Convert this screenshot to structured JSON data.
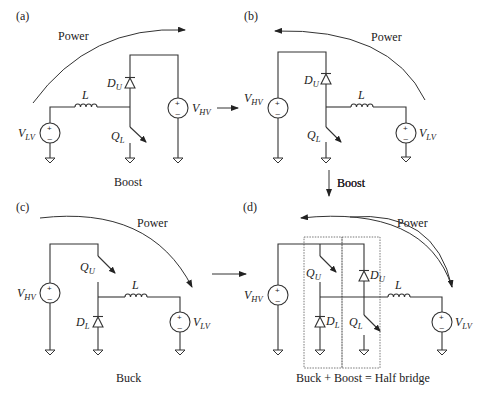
{
  "figure": {
    "panels": [
      {
        "id": "a",
        "tag": "(a)",
        "caption": "Boost",
        "power_label": "Power",
        "power_direction": "left-to-right",
        "components": {
          "source_low": {
            "name": "V",
            "sub": "LV"
          },
          "source_high": {
            "name": "V",
            "sub": "HV"
          },
          "inductor": {
            "name": "L"
          },
          "diode": {
            "name": "D",
            "sub": "U"
          },
          "switch": {
            "name": "Q",
            "sub": "L"
          }
        }
      },
      {
        "id": "b",
        "tag": "(b)",
        "caption": "Boost",
        "power_label": "Power",
        "power_direction": "right-to-left",
        "components": {
          "source_high": {
            "name": "V",
            "sub": "HV"
          },
          "source_low": {
            "name": "V",
            "sub": "LV"
          },
          "inductor": {
            "name": "L"
          },
          "diode": {
            "name": "D",
            "sub": "U"
          },
          "switch": {
            "name": "Q",
            "sub": "L"
          }
        }
      },
      {
        "id": "c",
        "tag": "(c)",
        "caption": "Buck",
        "power_label": "Power",
        "power_direction": "left-to-right",
        "components": {
          "source_high": {
            "name": "V",
            "sub": "HV"
          },
          "source_low": {
            "name": "V",
            "sub": "LV"
          },
          "inductor": {
            "name": "L"
          },
          "diode": {
            "name": "D",
            "sub": "L"
          },
          "switch": {
            "name": "Q",
            "sub": "U"
          }
        }
      },
      {
        "id": "d",
        "tag": "(d)",
        "caption": "Buck + Boost = Half bridge",
        "power_label": "Power",
        "power_direction": "bidirectional",
        "components": {
          "source_high": {
            "name": "V",
            "sub": "HV"
          },
          "source_low": {
            "name": "V",
            "sub": "LV"
          },
          "inductor": {
            "name": "L"
          },
          "switch_upper": {
            "name": "Q",
            "sub": "U"
          },
          "diode_upper": {
            "name": "D",
            "sub": "U"
          },
          "switch_lower": {
            "name": "Q",
            "sub": "L"
          },
          "diode_lower": {
            "name": "D",
            "sub": "L"
          }
        }
      }
    ],
    "transitions": [
      {
        "from": "a",
        "to": "b",
        "label": ""
      },
      {
        "from": "b",
        "to": "d",
        "label": "Boost"
      },
      {
        "from": "c",
        "to": "d",
        "label": ""
      }
    ],
    "source_signs": {
      "plus": "+",
      "minus": "–"
    }
  }
}
